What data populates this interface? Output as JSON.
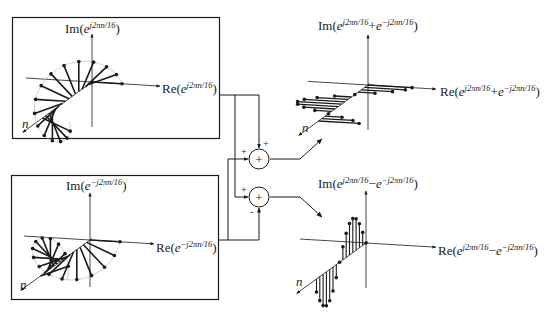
{
  "figure": {
    "background": "#ffffff",
    "ink": "#1a1a1a",
    "guide_color": "#bdbdbd"
  },
  "panels": {
    "input_positive": {
      "im_label": {
        "prefix": "Im(",
        "base": "e",
        "exp": "j2πn/16",
        "suffix": ")"
      },
      "re_label": {
        "prefix": "Re(",
        "base": "e",
        "exp": "j2πn/16",
        "suffix": ")"
      },
      "n_label": "n",
      "rotation": "counter-clockwise"
    },
    "input_negative": {
      "im_label": {
        "prefix": "Im(",
        "base": "e",
        "exp": "−j2πn/16",
        "suffix": ")"
      },
      "re_label": {
        "prefix": "Re(",
        "base": "e",
        "exp": "−j2πn/16",
        "suffix": ")"
      },
      "n_label": "n",
      "rotation": "clockwise"
    },
    "output_sum": {
      "im_label": {
        "prefix": "Im(",
        "base": "e",
        "exp": "j2πn/16",
        "op": "+",
        "base2": "e",
        "exp2": "−j2πn/16",
        "suffix": ")"
      },
      "re_label": {
        "prefix": "Re(",
        "base": "e",
        "exp": "j2πn/16",
        "op": "+",
        "base2": "e",
        "exp2": "−j2πn/16",
        "suffix": ")"
      },
      "n_label": "n",
      "result": "2cos(2πn/16) — purely real"
    },
    "output_difference": {
      "im_label": {
        "prefix": "Im(",
        "base": "e",
        "exp": "j2πn/16",
        "op": "−",
        "base2": "e",
        "exp2": "−j2πn/16",
        "suffix": ")"
      },
      "re_label": {
        "prefix": "Re(",
        "base": "e",
        "exp": "j2πn/16",
        "op": "−",
        "base2": "e",
        "exp2": "−j2πn/16",
        "suffix": ")"
      },
      "n_label": "n",
      "result": "2j·sin(2πn/16) — purely imaginary"
    }
  },
  "junctions": {
    "adder": {
      "symbol": "+",
      "input_signs": [
        "+",
        "+"
      ]
    },
    "subtractor": {
      "symbol": "+",
      "input_signs": [
        "+",
        "-"
      ]
    }
  },
  "sequence": {
    "period": 16,
    "samples_shown": 16
  }
}
